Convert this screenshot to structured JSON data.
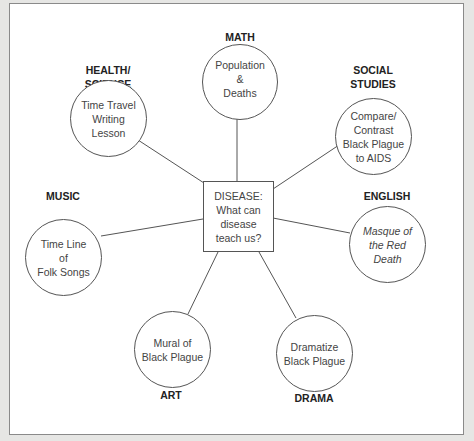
{
  "diagram": {
    "center": {
      "text": "DISEASE:\nWhat can\ndisease\nteach us?"
    },
    "nodes": [
      {
        "id": "math",
        "subject": "MATH",
        "activity": "Population\n&\nDeaths",
        "italic": false
      },
      {
        "id": "health-science",
        "subject": "HEALTH/\nSCIENCE",
        "activity": "Time Travel\nWriting\nLesson",
        "italic": false
      },
      {
        "id": "social-studies",
        "subject": "SOCIAL\nSTUDIES",
        "activity": "Compare/\nContrast\nBlack Plague\nto AIDS",
        "italic": false
      },
      {
        "id": "english",
        "subject": "ENGLISH",
        "activity": "Masque of\nthe Red\nDeath",
        "italic": true
      },
      {
        "id": "music",
        "subject": "MUSIC",
        "activity": "Time Line\nof\nFolk Songs",
        "italic": false
      },
      {
        "id": "art",
        "subject": "ART",
        "activity": "Mural of\nBlack Plague",
        "italic": false
      },
      {
        "id": "drama",
        "subject": "DRAMA",
        "activity": "Dramatize\nBlack Plague",
        "italic": false
      }
    ]
  },
  "colors": {
    "background": "#e6e6e4",
    "panel": "#ffffff",
    "stroke": "#555555"
  }
}
